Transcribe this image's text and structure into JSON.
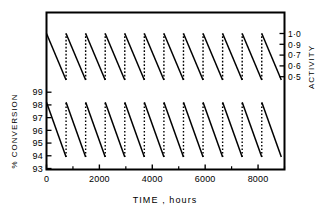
{
  "figure": {
    "background": "#ffffff",
    "line_color": "#000000",
    "frame_color": "#000000"
  },
  "chart_data": {
    "type": "line",
    "title": "",
    "subtitle": "",
    "xlabel": "TIME , hours",
    "ylabel": "% CONVERSION",
    "ylabel_right": "ACTIVITY",
    "xlim": [
      0,
      9000
    ],
    "ylim_left": [
      93,
      99.6
    ],
    "ylim_right": [
      0.44,
      1.06
    ],
    "grid": false,
    "legend": null,
    "x_ticks_major": [
      0,
      2000,
      4000,
      6000,
      8000
    ],
    "x_tick_labels": [
      "0",
      "2000",
      "4000",
      "6000",
      "8000"
    ],
    "x_ticks_minor": [
      1000,
      3000,
      5000,
      7000,
      9000
    ],
    "y_ticks_left": [
      93,
      94,
      95,
      96,
      97,
      98,
      99
    ],
    "y_tick_labels_left": [
      "93",
      "94",
      "95",
      "96",
      "97",
      "98",
      "99"
    ],
    "y_ticks_right": [
      0.5,
      0.6,
      0.7,
      0.9,
      1.0
    ],
    "y_tick_labels_right": [
      "0·0",
      "0·6",
      "0·7",
      "0·9",
      "1·0"
    ],
    "y_tick_labels_right_display": [
      "1·0",
      "0·9",
      "0·7",
      "0·6",
      "0·5"
    ],
    "series": [
      {
        "name": "ACTIVITY",
        "axis": "right",
        "style": "sawtooth-decay",
        "description": "Catalyst activity decays from 1.0 to about 0.57 each cycle then is regenerated (dotted vertical riser) back to 1.0",
        "cycle_start_value": 1.0,
        "cycle_end_value": 0.57,
        "n_cycles": 12,
        "cycle_boundaries_hours": [
          0,
          740,
          1480,
          2220,
          2960,
          3700,
          4440,
          5180,
          5920,
          6660,
          7400,
          8140,
          8880
        ],
        "first_segment_start_hours": 0,
        "first_segment_start_value": 1.0
      },
      {
        "name": "% CONVERSION",
        "axis": "left",
        "style": "sawtooth-decay",
        "description": "Conversion decays from about 98.2% to about 93.9% each cycle then recovers (dotted vertical riser)",
        "cycle_start_value": 98.2,
        "cycle_end_value": 93.9,
        "n_cycles": 12,
        "cycle_boundaries_hours": [
          0,
          740,
          1480,
          2220,
          2960,
          3700,
          4440,
          5180,
          5920,
          6660,
          7400,
          8140,
          8880
        ],
        "first_segment_start_hours": 0,
        "first_segment_start_value": 98.2
      }
    ]
  }
}
